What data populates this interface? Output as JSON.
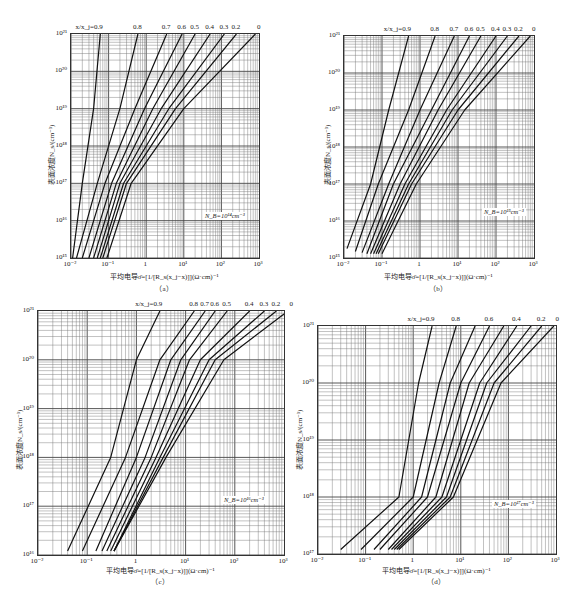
{
  "chart_data": [
    {
      "type": "line",
      "panel": "(a)",
      "title": "",
      "xlabel": "平均电导σ̄=[1/[R_s(x_j−x)]](Ω·cm)⁻¹",
      "ylabel": "表面浓度N_s/(cm⁻³)",
      "xscale": "log",
      "yscale": "log",
      "xlim": [
        0.01,
        1000
      ],
      "ylim": [
        1000000000000000.0,
        1e+21
      ],
      "xticks": [
        "10⁻²",
        "10⁻¹",
        "1",
        "10¹",
        "10²",
        "10³"
      ],
      "yticks": [
        "10¹⁵",
        "10¹⁶",
        "10¹⁷",
        "10¹⁸",
        "10¹⁹",
        "10²⁰",
        "10²¹"
      ],
      "annotation": "N_B=10¹⁴cm⁻³",
      "grid": true,
      "series_label_prefix": "x/x_j=",
      "series": [
        {
          "name": "0.9",
          "x": [
            0.011,
            0.02,
            0.04,
            0.06
          ],
          "y": [
            1000000000000000.0,
            1e+17,
            1e+19,
            1e+21
          ]
        },
        {
          "name": "0.8",
          "x": [
            0.014,
            0.05,
            0.2,
            0.6
          ],
          "y": [
            1000000000000000.0,
            1e+17,
            1e+19,
            1e+21
          ]
        },
        {
          "name": "0.7",
          "x": [
            0.02,
            0.08,
            0.5,
            3.5
          ],
          "y": [
            1000000000000000.0,
            1e+17,
            1e+19,
            1e+21
          ]
        },
        {
          "name": "0.6",
          "x": [
            0.03,
            0.12,
            0.9,
            9
          ],
          "y": [
            1000000000000000.0,
            1e+17,
            1e+19,
            1e+21
          ]
        },
        {
          "name": "0.5",
          "x": [
            0.04,
            0.16,
            1.5,
            20
          ],
          "y": [
            1000000000000000.0,
            1e+17,
            1e+19,
            1e+21
          ]
        },
        {
          "name": "0.4",
          "x": [
            0.05,
            0.2,
            2.5,
            50
          ],
          "y": [
            1000000000000000.0,
            1e+17,
            1e+19,
            1e+21
          ]
        },
        {
          "name": "0.3",
          "x": [
            0.06,
            0.25,
            4,
            120
          ],
          "y": [
            1000000000000000.0,
            1e+17,
            1e+19,
            1e+21
          ]
        },
        {
          "name": "0.2",
          "x": [
            0.07,
            0.3,
            6,
            250
          ],
          "y": [
            1000000000000000.0,
            1e+17,
            1e+19,
            1e+21
          ]
        },
        {
          "name": "0",
          "x": [
            0.09,
            0.4,
            10,
            800
          ],
          "y": [
            1000000000000000.0,
            1e+17,
            1e+19,
            1e+21
          ]
        }
      ]
    },
    {
      "type": "line",
      "panel": "(b)",
      "xlabel": "平均电导σ̄=[1/[R_s(x_j−x)]](Ω·cm)⁻¹",
      "ylabel": "表面浓度N_s/(cm⁻³)",
      "xscale": "log",
      "yscale": "log",
      "xlim": [
        0.01,
        1000
      ],
      "ylim": [
        1000000000000000.0,
        1e+21
      ],
      "xticks": [
        "10⁻²",
        "10⁻¹",
        "1",
        "10¹",
        "10²",
        "10³"
      ],
      "yticks": [
        "10¹⁵",
        "10¹⁶",
        "10¹⁷",
        "10¹⁸",
        "10¹⁹",
        "10²⁰",
        "10²¹"
      ],
      "annotation": "N_B=10¹⁵cm⁻³",
      "grid": true,
      "series_label_prefix": "x/x_j=",
      "series": [
        {
          "name": "0.9",
          "x": [
            0.012,
            0.05,
            0.15,
            0.5
          ],
          "y": [
            1800000000000000.0,
            1e+17,
            1e+19,
            1e+21
          ]
        },
        {
          "name": "0.8",
          "x": [
            0.02,
            0.08,
            0.5,
            2.5
          ],
          "y": [
            1500000000000000.0,
            1e+17,
            1e+19,
            1e+21
          ]
        },
        {
          "name": "0.7",
          "x": [
            0.03,
            0.15,
            1,
            8
          ],
          "y": [
            1400000000000000.0,
            1e+17,
            1e+19,
            1e+21
          ]
        },
        {
          "name": "0.6",
          "x": [
            0.04,
            0.2,
            2,
            20
          ],
          "y": [
            1300000000000000.0,
            1e+17,
            1e+19,
            1e+21
          ]
        },
        {
          "name": "0.5",
          "x": [
            0.05,
            0.3,
            3,
            40
          ],
          "y": [
            1300000000000000.0,
            1e+17,
            1e+19,
            1e+21
          ]
        },
        {
          "name": "0.4",
          "x": [
            0.06,
            0.4,
            5,
            100
          ],
          "y": [
            1300000000000000.0,
            1e+17,
            1e+19,
            1e+21
          ]
        },
        {
          "name": "0.3",
          "x": [
            0.07,
            0.5,
            7,
            200
          ],
          "y": [
            1300000000000000.0,
            1e+17,
            1e+19,
            1e+21
          ]
        },
        {
          "name": "0.2",
          "x": [
            0.08,
            0.6,
            10,
            400
          ],
          "y": [
            1300000000000000.0,
            1e+17,
            1e+19,
            1e+21
          ]
        },
        {
          "name": "0",
          "x": [
            0.1,
            0.8,
            15,
            800
          ],
          "y": [
            1300000000000000.0,
            1e+17,
            1e+19,
            1e+21
          ]
        }
      ]
    },
    {
      "type": "line",
      "panel": "(c)",
      "xlabel": "平均电导σ̄=[1/[R_s(x_j−x)]](Ω·cm)⁻¹",
      "ylabel": "表面浓度N_s/(cm⁻³)",
      "xscale": "log",
      "yscale": "log",
      "xlim": [
        0.01,
        1000
      ],
      "ylim": [
        1e+16,
        1e+21
      ],
      "xticks": [
        "10⁻²",
        "10⁻¹",
        "1",
        "10¹",
        "10²",
        "10³"
      ],
      "yticks": [
        "10¹⁶",
        "10¹⁷",
        "10¹⁸",
        "10¹⁹",
        "10²⁰",
        "10²¹"
      ],
      "annotation": "N_B=10¹⁶cm⁻³",
      "grid": true,
      "series_label_prefix": "x/x_j=",
      "series": [
        {
          "name": "0.9",
          "x": [
            0.04,
            0.3,
            1,
            3
          ],
          "y": [
            1.2e+16,
            1e+18,
            1e+20,
            1e+21
          ]
        },
        {
          "name": "0.8",
          "x": [
            0.08,
            0.6,
            3,
            15
          ],
          "y": [
            1.2e+16,
            1e+18,
            1e+20,
            1e+21
          ]
        },
        {
          "name": "0.7",
          "x": [
            0.15,
            1,
            5,
            25
          ],
          "y": [
            1.2e+16,
            1e+18,
            1e+20,
            1e+21
          ]
        },
        {
          "name": "0.6",
          "x": [
            0.2,
            1.5,
            8,
            40
          ],
          "y": [
            1.2e+16,
            1e+18,
            1e+20,
            1e+21
          ]
        },
        {
          "name": "0.5",
          "x": [
            0.25,
            2,
            12,
            70
          ],
          "y": [
            1.2e+16,
            1e+18,
            1e+20,
            1e+21
          ]
        },
        {
          "name": "0.4",
          "x": [
            0.3,
            2.5,
            20,
            200
          ],
          "y": [
            1.2e+16,
            1e+18,
            1e+20,
            1e+21
          ]
        },
        {
          "name": "0.3",
          "x": [
            0.35,
            3,
            30,
            400
          ],
          "y": [
            1.2e+16,
            1e+18,
            1e+20,
            1e+21
          ]
        },
        {
          "name": "0.2",
          "x": [
            0.35,
            3.5,
            40,
            700
          ],
          "y": [
            1.2e+16,
            1e+18,
            1e+20,
            1e+21
          ]
        },
        {
          "name": "0",
          "x": [
            0.35,
            4,
            60,
            1200
          ],
          "y": [
            1.2e+16,
            1e+18,
            1e+20,
            1e+21
          ]
        }
      ]
    },
    {
      "type": "line",
      "panel": "(d)",
      "xlabel": "平均电导σ̄=[1/[R_s(x_j−x)]](Ω·cm)⁻¹",
      "ylabel": "表面浓度N_s/(cm⁻³)",
      "xscale": "log",
      "yscale": "log",
      "xlim": [
        0.01,
        1000
      ],
      "ylim": [
        1e+17,
        1e+21
      ],
      "xticks": [
        "10⁻²",
        "10⁻¹",
        "1",
        "10¹",
        "10²",
        "10³"
      ],
      "yticks": [
        "10¹⁷",
        "10¹⁸",
        "10¹⁹",
        "10²⁰",
        "10²¹"
      ],
      "annotation": "N_B=10¹⁷cm⁻³",
      "grid": true,
      "series_label_prefix": "x/x_j=",
      "series": [
        {
          "name": "0.9",
          "x": [
            0.03,
            0.5,
            1.3,
            2.5
          ],
          "y": [
            1.2e+17,
            1e+18,
            1e+20,
            1e+21
          ]
        },
        {
          "name": "0.8",
          "x": [
            0.08,
            1,
            3.5,
            8
          ],
          "y": [
            1.2e+17,
            1e+18,
            1e+20,
            1e+21
          ]
        },
        {
          "name": "0.7",
          "x": [
            0.15,
            1.5,
            6,
            20
          ],
          "y": [
            1.2e+17,
            1e+18,
            1e+20,
            1e+21
          ]
        },
        {
          "name": "0.6",
          "x": [
            0.2,
            2,
            10,
            40
          ],
          "y": [
            1.2e+17,
            1e+18,
            1e+20,
            1e+21
          ]
        },
        {
          "name": "0.5",
          "x": [
            0.3,
            3,
            15,
            80
          ],
          "y": [
            1.2e+17,
            1e+18,
            1e+20,
            1e+21
          ]
        },
        {
          "name": "0.4",
          "x": [
            0.35,
            4,
            25,
            150
          ],
          "y": [
            1.2e+17,
            1e+18,
            1e+20,
            1e+21
          ]
        },
        {
          "name": "0.3",
          "x": [
            0.4,
            5,
            35,
            300
          ],
          "y": [
            1.2e+17,
            1e+18,
            1e+20,
            1e+21
          ]
        },
        {
          "name": "0.2",
          "x": [
            0.45,
            6,
            50,
            500
          ],
          "y": [
            1.2e+17,
            1e+18,
            1e+20,
            1e+21
          ]
        },
        {
          "name": "0",
          "x": [
            0.5,
            7,
            70,
            900
          ],
          "y": [
            1.2e+17,
            1e+18,
            1e+20,
            1e+21
          ]
        }
      ]
    }
  ],
  "panels": {
    "a": {
      "sub_label": "（a）",
      "nb_label": "N_B=10¹⁴cm⁻³",
      "top_labels": [
        "x/x_j=0.9",
        "0.8",
        "0.7",
        "0.6",
        "0.5",
        "0.4",
        "0.3",
        "0.2",
        "0"
      ],
      "y_ticks": [
        "10²¹",
        "10²⁰",
        "10¹⁹",
        "10¹⁸",
        "10¹⁷",
        "10¹⁶",
        "10¹⁵"
      ]
    },
    "b": {
      "sub_label": "（b）",
      "nb_label": "N_B=10¹⁵cm⁻³",
      "top_labels": [
        "x/x_j=0.9",
        "0.8",
        "0.7",
        "0.6",
        "0.5",
        "0.4",
        "0.3",
        "0.2",
        "0"
      ],
      "y_ticks": [
        "10²¹",
        "10²⁰",
        "10¹⁹",
        "10¹⁸",
        "10¹⁷",
        "10¹⁶",
        "10¹⁵"
      ]
    },
    "c": {
      "sub_label": "（c）",
      "nb_label": "N_B=10¹⁶cm⁻³",
      "top_labels": [
        "x/x_j=0.9",
        "0.8",
        "0.7",
        "0.6",
        "0.5",
        "0.4",
        "0.3",
        "0.2",
        "0"
      ],
      "y_ticks": [
        "10²¹",
        "10²⁰",
        "10¹⁹",
        "10¹⁸",
        "10¹⁷",
        "10¹⁶"
      ]
    },
    "d": {
      "sub_label": "（d）",
      "nb_label": "N_B=10¹⁷cm⁻³",
      "top_labels": [
        "x/x_j=0.9",
        "0.8",
        "0.6",
        "0.4",
        "0.2",
        "0"
      ],
      "y_ticks": [
        "10²¹",
        "10²⁰",
        "10¹⁹",
        "10¹⁸",
        "10¹⁷"
      ]
    }
  },
  "shared": {
    "ylabel": "表面浓度N_s/(cm⁻³)",
    "xlabel": "平均电导σ̄=[1/[R_s(x_j−x)]](Ω·cm)⁻¹",
    "x_ticks": [
      "10⁻²",
      "10⁻¹",
      "1",
      "10¹",
      "10²",
      "10³"
    ]
  }
}
